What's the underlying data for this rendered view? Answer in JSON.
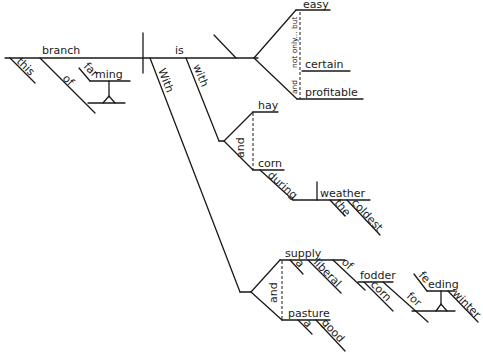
{
  "diagram": {
    "type": "sentence-diagram",
    "subject": {
      "word": "branch",
      "modifiers": [
        "this",
        "of"
      ],
      "of_object": "farming"
    },
    "verb": "is",
    "predicate_adjectives": {
      "items": [
        "easy",
        "certain",
        "profitable"
      ],
      "conjunction": "not only... but",
      "conjunction2": "and"
    },
    "with_phrase": {
      "preposition": "with",
      "objects": [
        "hay",
        "corn"
      ],
      "conjunction": "and",
      "during": "during",
      "during_object": "weather",
      "during_modifiers": [
        "the",
        "coldest"
      ]
    },
    "With_phrase": {
      "preposition": "With",
      "objects": [
        "supply",
        "pasture"
      ],
      "conjunction": "and",
      "supply_modifiers": [
        "a",
        "liberal"
      ],
      "of": "of",
      "of_object": "fodder",
      "fodder_modifier": "corn",
      "for": "for",
      "for_object_verb": "feeding",
      "for_object_modifier": "winter",
      "pasture_modifiers": [
        "a",
        "good"
      ]
    }
  }
}
